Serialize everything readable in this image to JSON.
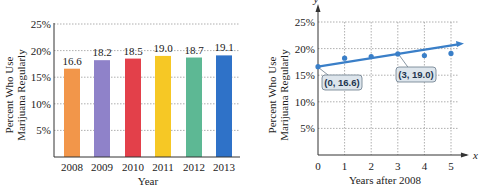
{
  "chart_data": [
    {
      "type": "bar",
      "title": "",
      "xlabel": "Year",
      "ylabel": "Percent Who Use Marijuana Regularly",
      "ylabel_lines": [
        "Percent Who Use",
        "Marijuana Regularly"
      ],
      "categories": [
        "2008",
        "2009",
        "2010",
        "2011",
        "2012",
        "2013"
      ],
      "values": [
        16.6,
        18.2,
        18.5,
        19.0,
        18.7,
        19.1
      ],
      "value_labels": [
        "16.6",
        "18.2",
        "18.5",
        "19.0",
        "18.7",
        "19.1"
      ],
      "bar_colors": [
        "#f2964a",
        "#8f82c9",
        "#e3404a",
        "#f6c825",
        "#5db894",
        "#2f72c8"
      ],
      "yticks": [
        "5%",
        "10%",
        "15%",
        "20%",
        "25%"
      ],
      "ylim": [
        0,
        25
      ],
      "grid": "dotted horizontal"
    },
    {
      "type": "scatter",
      "title": "",
      "xlabel": "Years after 2008",
      "ylabel": "Percent Who Use Marijuana Regularly",
      "ylabel_lines": [
        "Percent Who Use",
        "Marijuana Regularly"
      ],
      "x_axis_symbol": "x",
      "y_axis_symbol": "y",
      "x": [
        0,
        1,
        2,
        3,
        4,
        5
      ],
      "y": [
        16.6,
        18.2,
        18.5,
        19.0,
        18.7,
        19.1
      ],
      "xticks": [
        "0",
        "1",
        "2",
        "3",
        "4",
        "5"
      ],
      "yticks": [
        "5%",
        "10%",
        "15%",
        "20%",
        "25%"
      ],
      "ylim": [
        0,
        25
      ],
      "xlim": [
        0,
        5.5
      ],
      "grid": "dotted",
      "trend_line": {
        "from": [
          0,
          16.6
        ],
        "through": [
          3,
          19.0
        ],
        "color": "#3a7fc8"
      },
      "annotations": [
        "(0, 16.6)",
        "(3, 19.0)"
      ],
      "point_color": "#3a7fc8"
    }
  ]
}
